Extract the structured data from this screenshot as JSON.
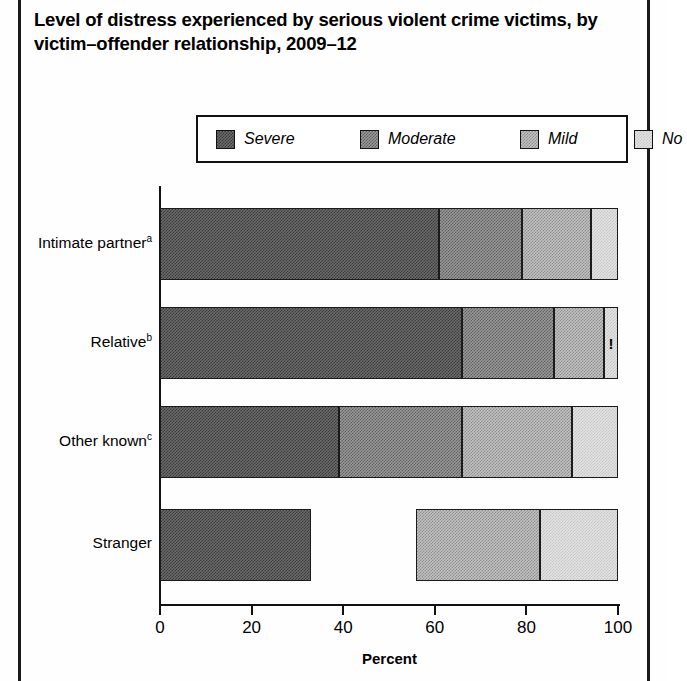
{
  "figure": {
    "title": "Level of distress experienced by serious violent crime victims, by victim–offender relationship, 2009–12"
  },
  "legend": {
    "items": [
      {
        "label": "Severe",
        "color": "#4a4a4a",
        "key": "severe"
      },
      {
        "label": "Moderate",
        "color": "#777777",
        "key": "moderate"
      },
      {
        "label": "Mild",
        "color": "#a8a8a8",
        "key": "mild"
      },
      {
        "label": "No",
        "color": "#d8d8d8",
        "key": "no"
      }
    ]
  },
  "axis": {
    "x_label": "Percent",
    "x_ticks": [
      "0",
      "20",
      "40",
      "60",
      "80",
      "100"
    ],
    "x_min": 0,
    "x_max": 100
  },
  "annotations": {
    "interpret_with_caution_marker": "!"
  },
  "categories": [
    {
      "label": "Intimate partner",
      "superscript": "a"
    },
    {
      "label": "Relative",
      "superscript": "b"
    },
    {
      "label": "Other known",
      "superscript": "c"
    },
    {
      "label": "Stranger",
      "superscript": ""
    }
  ],
  "chart_data": {
    "type": "bar",
    "orientation": "horizontal",
    "stacked": true,
    "title": "Level of distress experienced by serious violent crime victims, by victim–offender relationship, 2009–12",
    "xlabel": "Percent",
    "ylabel": "",
    "xlim": [
      0,
      100
    ],
    "grid": false,
    "legend_position": "top",
    "categories": [
      "Intimate partner",
      "Relative",
      "Other known",
      "Stranger"
    ],
    "series": [
      {
        "name": "Severe",
        "values": [
          61,
          66,
          39,
          33
        ]
      },
      {
        "name": "Moderate",
        "values": [
          18,
          20,
          27,
          null
        ]
      },
      {
        "name": "Mild",
        "values": [
          15,
          11,
          24,
          27
        ]
      },
      {
        "name": "No",
        "values": [
          6,
          3,
          10,
          17
        ]
      }
    ],
    "segment_bounds": {
      "Intimate partner": [
        0,
        61,
        79,
        94,
        100
      ],
      "Relative": [
        0,
        66,
        86,
        97,
        100
      ],
      "Other known": [
        0,
        39,
        66,
        90,
        100
      ],
      "Stranger": [
        0,
        33,
        null,
        56,
        83,
        100
      ]
    },
    "notes": [
      "Stranger Moderate value suppressed (not displayed)",
      "'!' marks an estimate to be interpreted with caution in the Relative / No distress segment"
    ]
  },
  "bars": [
    {
      "category": "Intimate partner",
      "segments": [
        {
          "key": "severe",
          "start": 0,
          "end": 61,
          "flag": ""
        },
        {
          "key": "moderate",
          "start": 61,
          "end": 79,
          "flag": ""
        },
        {
          "key": "mild",
          "start": 79,
          "end": 94,
          "flag": ""
        },
        {
          "key": "no",
          "start": 94,
          "end": 100,
          "flag": ""
        }
      ]
    },
    {
      "category": "Relative",
      "segments": [
        {
          "key": "severe",
          "start": 0,
          "end": 66,
          "flag": ""
        },
        {
          "key": "moderate",
          "start": 66,
          "end": 86,
          "flag": ""
        },
        {
          "key": "mild",
          "start": 86,
          "end": 97,
          "flag": ""
        },
        {
          "key": "no",
          "start": 97,
          "end": 100,
          "flag": "!"
        }
      ]
    },
    {
      "category": "Other known",
      "segments": [
        {
          "key": "severe",
          "start": 0,
          "end": 39,
          "flag": ""
        },
        {
          "key": "moderate",
          "start": 39,
          "end": 66,
          "flag": ""
        },
        {
          "key": "mild",
          "start": 66,
          "end": 90,
          "flag": ""
        },
        {
          "key": "no",
          "start": 90,
          "end": 100,
          "flag": ""
        }
      ]
    },
    {
      "category": "Stranger",
      "segments": [
        {
          "key": "severe",
          "start": 0,
          "end": 33,
          "flag": ""
        },
        {
          "key": "gap",
          "start": 33,
          "end": 56,
          "flag": ""
        },
        {
          "key": "mild",
          "start": 56,
          "end": 83,
          "flag": ""
        },
        {
          "key": "no",
          "start": 83,
          "end": 100,
          "flag": ""
        }
      ]
    }
  ]
}
